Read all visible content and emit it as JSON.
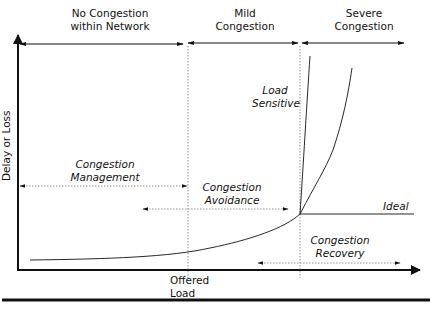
{
  "diagram": {
    "regions": [
      {
        "label_line1": "No Congestion",
        "label_line2": "within Network"
      },
      {
        "label_line1": "Mild",
        "label_line2": "Congestion"
      },
      {
        "label_line1": "Severe",
        "label_line2": "Congestion"
      }
    ],
    "axes": {
      "y_label": "Delay or Loss",
      "x_label_line1": "Offered",
      "x_label_line2": "Load"
    },
    "curves": {
      "load_sensitive_line1": "Load",
      "load_sensitive_line2": "Sensitive",
      "ideal": "Ideal"
    },
    "strategies": [
      {
        "label_line1": "Congestion",
        "label_line2": "Management"
      },
      {
        "label_line1": "Congestion",
        "label_line2": "Avoidance"
      },
      {
        "label_line1": "Congestion",
        "label_line2": "Recovery"
      }
    ],
    "colors": {
      "ink": "#111111",
      "dotted": "#777777"
    }
  }
}
